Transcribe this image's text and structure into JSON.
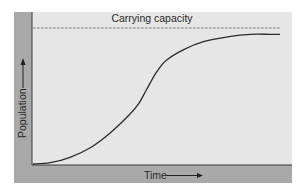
{
  "chart_data": {
    "type": "line",
    "title": "",
    "xlabel": "Time",
    "ylabel": "Population",
    "annotations": [
      {
        "text": "Carrying capacity",
        "kind": "horizontal-dashed-line",
        "y": 1.0
      }
    ],
    "grid": false,
    "legend": null,
    "ticks": "none",
    "xlim": [
      0,
      1
    ],
    "ylim": [
      0,
      1.03
    ],
    "series": [
      {
        "name": "Population (logistic growth)",
        "x": [
          0.0,
          0.07,
          0.15,
          0.23,
          0.31,
          0.39,
          0.43,
          0.46,
          0.5,
          0.54,
          0.61,
          0.69,
          0.8,
          0.88,
          0.96,
          1.0
        ],
        "y": [
          0.0,
          0.01,
          0.05,
          0.12,
          0.23,
          0.37,
          0.46,
          0.56,
          0.69,
          0.78,
          0.86,
          0.92,
          0.96,
          0.975,
          0.975,
          0.975
        ]
      }
    ],
    "capacity": 1.0
  },
  "colors": {
    "panel": "#e6e6e6",
    "band": "#a9a9a9",
    "axis": "#3a3a3a",
    "curve": "#2b2b2b",
    "dash": "#555555",
    "text": "#2a2a2a"
  }
}
